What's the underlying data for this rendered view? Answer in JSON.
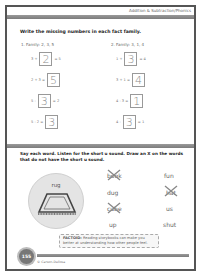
{
  "header": {
    "title": "Addition & Subtraction/Phonics"
  },
  "section1": {
    "instruction": "Write the missing numbers in each fact family.",
    "families": [
      {
        "label": "1.  Family: 2, 3, 5",
        "equations": [
          {
            "left": "3 +",
            "answer": "2",
            "right": "= 5"
          },
          {
            "left": "2 + 3 =",
            "answer": "5",
            "right": ""
          },
          {
            "left": "5 -",
            "answer": "3",
            "right": "= 2"
          },
          {
            "left": "5 - 2 =",
            "answer": "3",
            "right": ""
          }
        ]
      },
      {
        "label": "2.  Family: 3, 1, 4",
        "equations": [
          {
            "left": "1 +",
            "answer": "3",
            "right": "= 4"
          },
          {
            "left": "3 + 1 =",
            "answer": "4",
            "right": ""
          },
          {
            "left": "4 - 3 =",
            "answer": "1",
            "right": ""
          },
          {
            "left": "4 -",
            "answer": "3",
            "right": "= 1"
          }
        ]
      }
    ]
  },
  "section2": {
    "instruction": "Say each word. Listen for the short u sound. Draw an X on the words that do not have the short u sound.",
    "example_word": "rug",
    "words_col1": [
      {
        "text": "book",
        "crossed": true
      },
      {
        "text": "dug",
        "crossed": false
      },
      {
        "text": "cube",
        "crossed": true
      },
      {
        "text": "up",
        "crossed": false
      }
    ],
    "words_col2": [
      {
        "text": "fun",
        "crossed": false
      },
      {
        "text": "hat",
        "crossed": true
      },
      {
        "text": "us",
        "crossed": false
      },
      {
        "text": "shut",
        "crossed": false
      }
    ]
  },
  "factoid": {
    "label": "FACTOID:",
    "text": "Reading storybooks can make you better at understanding how other people feel."
  },
  "footer": {
    "page_number": "155",
    "copyright": "© Carson-Dellosa"
  },
  "colors": {
    "bar": "#8a8a8a",
    "border": "#555555",
    "answer_text": "#8a8a8a"
  }
}
